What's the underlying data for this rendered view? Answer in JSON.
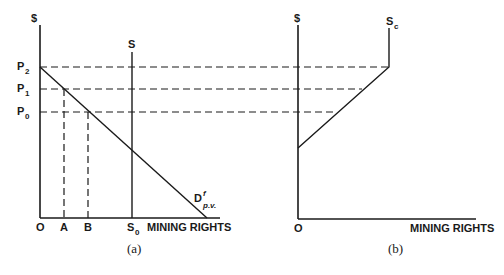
{
  "panel_a": {
    "caption": "(a)",
    "y_axis_label": "$",
    "x_axis_label": "MINING RIGHTS",
    "origin_label": "O",
    "price_labels": [
      {
        "main": "P",
        "sub": "2"
      },
      {
        "main": "P",
        "sub": "1"
      },
      {
        "main": "P",
        "sub": "0"
      }
    ],
    "quantity_labels": [
      {
        "main": "A",
        "sub": ""
      },
      {
        "main": "B",
        "sub": ""
      },
      {
        "main": "S",
        "sub": "0"
      }
    ],
    "supply_label": "S",
    "demand_label": {
      "main": "D",
      "sup": "f",
      "sub": "p.v."
    }
  },
  "panel_b": {
    "caption": "(b)",
    "y_axis_label": "$",
    "x_axis_label": "MINING RIGHTS",
    "origin_label": "O",
    "supply_label": {
      "main": "S",
      "sub": "c"
    }
  },
  "diagram": {
    "line_color": "#1a1a1a",
    "background": "#ffffff"
  }
}
